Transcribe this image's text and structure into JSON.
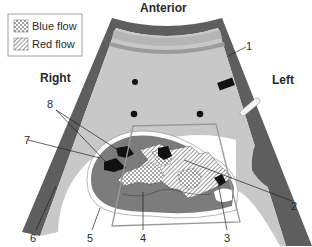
{
  "orientation": {
    "top": "Anterior",
    "right_side": "Right",
    "left_side": "Left"
  },
  "legend": {
    "items": [
      {
        "label": "Blue flow",
        "pattern": "dotted"
      },
      {
        "label": "Red flow",
        "pattern": "hatched"
      }
    ]
  },
  "callouts": [
    {
      "number": "1"
    },
    {
      "number": "2"
    },
    {
      "number": "3"
    },
    {
      "number": "4"
    },
    {
      "number": "5"
    },
    {
      "number": "6"
    },
    {
      "number": "7"
    },
    {
      "number": "8"
    }
  ],
  "colors": {
    "wall_dark": "#5e5e5e",
    "field_light": "#c8c8c8",
    "band_stripe": "#a9a9a9",
    "heart_fill": "#7c7c7c",
    "sector_outline": "#9a9a9a",
    "black_shapes": "#111111",
    "background": "#ffffff"
  }
}
